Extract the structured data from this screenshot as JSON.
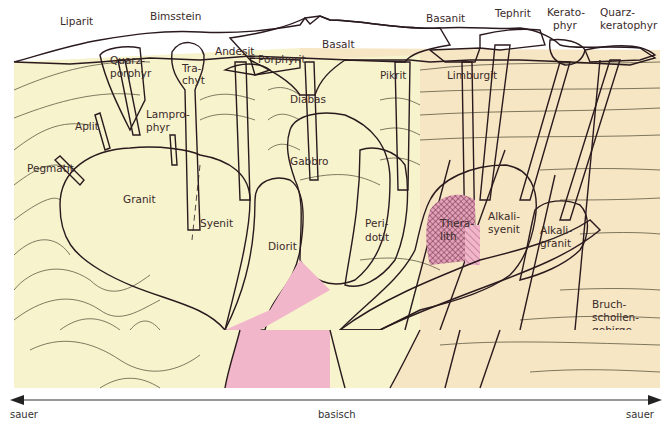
{
  "diagram": {
    "colors": {
      "fold_mountains_bg": "#f7f3cd",
      "block_mountains_bg": "#f6e6c4",
      "magma_pink": "#f2b6cb",
      "outline": "#2a1a1e",
      "hatch": "#7a3a4e"
    },
    "volcanic_rocks": [
      {
        "label": "Liparit"
      },
      {
        "label": "Bimsstein"
      },
      {
        "label": "Quarz-",
        "label2": "porphyr"
      },
      {
        "label": "Tra-",
        "label2": "chyt"
      },
      {
        "label": "Andesit"
      },
      {
        "label": "Porphyrit"
      },
      {
        "label": "Basalt"
      },
      {
        "label": "Diabas"
      },
      {
        "label": "Pikrit"
      },
      {
        "label": "Basanit"
      },
      {
        "label": "Limburgit"
      },
      {
        "label": "Tephrit"
      },
      {
        "label": "Kerato-",
        "label2": "phyr"
      },
      {
        "label": "Quarz-",
        "label2": "keratophyr"
      }
    ],
    "dike_rocks": [
      {
        "label": "Aplit"
      },
      {
        "label": "Lampro-",
        "label2": "phyr"
      },
      {
        "label": "Pegmatit"
      }
    ],
    "plutonic_rocks": [
      {
        "label": "Granit"
      },
      {
        "label": "Syenit"
      },
      {
        "label": "Diorit"
      },
      {
        "label": "Gabbro"
      },
      {
        "label": "Peri-",
        "label2": "dotit"
      },
      {
        "label": "Thera-",
        "label2": "lith"
      },
      {
        "label": "Alkali-",
        "label2": "syenit"
      },
      {
        "label": "Alkali-",
        "label2": "granit"
      }
    ],
    "regions": {
      "left": "Faltengebirge",
      "right_line1": "Bruch-",
      "right_line2": "schollen-",
      "right_line3": "gebirge"
    },
    "series": {
      "calc_alkaline_line1": "Kalk-",
      "calc_alkaline_line2": "alkali-",
      "calc_alkaline_line3": "sippe",
      "alkaline": "Alkalisippe"
    },
    "axis": {
      "left": "sauer",
      "center": "basisch",
      "right": "sauer"
    }
  }
}
